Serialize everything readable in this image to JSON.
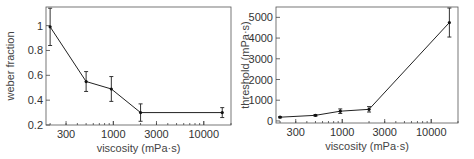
{
  "chart_data": [
    {
      "type": "line",
      "title": "",
      "xlabel": "viscosity (mPa·s)",
      "ylabel": "weber fraction",
      "xscale": "log",
      "xlim": [
        180,
        20000
      ],
      "ylim": [
        0.2,
        1.15
      ],
      "x_ticks": [
        300,
        1000,
        3000,
        10000
      ],
      "x_tick_labels": [
        "300",
        "1000",
        "3000",
        "10000"
      ],
      "y_ticks": [
        0.2,
        0.4,
        0.6,
        0.8,
        1.0
      ],
      "y_tick_labels": [
        "0.2",
        "0.4",
        "0.6",
        "0.8",
        "1"
      ],
      "grid": false,
      "series": [
        {
          "name": "weber fraction",
          "x": [
            200,
            500,
            950,
            2000,
            16000
          ],
          "values": [
            0.99,
            0.55,
            0.49,
            0.3,
            0.3
          ],
          "error": [
            0.15,
            0.08,
            0.1,
            0.07,
            0.04
          ]
        }
      ]
    },
    {
      "type": "line",
      "title": "",
      "xlabel": "viscosity (mPa·s)",
      "ylabel": "threshold (mPa·s)",
      "xscale": "log",
      "xlim": [
        180,
        20000
      ],
      "ylim": [
        -100,
        5500
      ],
      "x_ticks": [
        300,
        1000,
        3000,
        10000
      ],
      "x_tick_labels": [
        "300",
        "1000",
        "3000",
        "10000"
      ],
      "y_ticks": [
        0,
        1000,
        2000,
        3000,
        4000,
        5000
      ],
      "y_tick_labels": [
        "0",
        "1000",
        "2000",
        "3000",
        "4000",
        "5000"
      ],
      "grid": false,
      "series": [
        {
          "name": "threshold",
          "x": [
            200,
            500,
            950,
            2000,
            16000
          ],
          "values": [
            180,
            270,
            470,
            560,
            4750
          ],
          "error": [
            30,
            40,
            110,
            130,
            700
          ]
        }
      ]
    }
  ]
}
